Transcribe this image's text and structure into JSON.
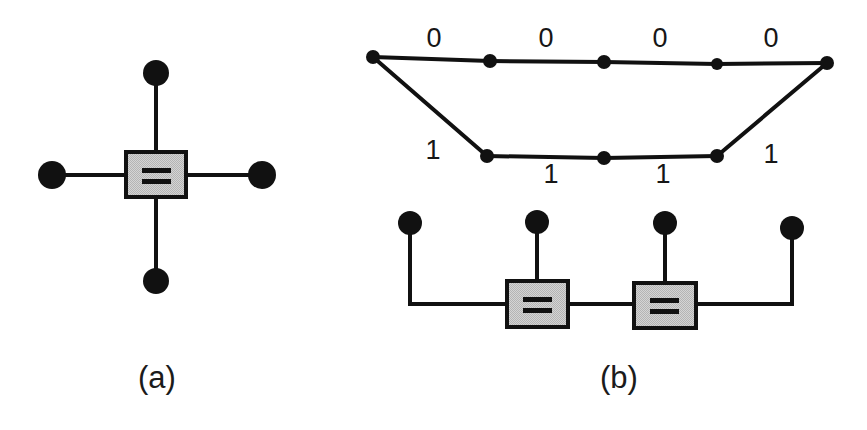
{
  "figure": {
    "background_color": "#ffffff",
    "ink_color": "#111111",
    "box_fill_color": "#c8c8c8",
    "box_border_color": "#111111",
    "panels": [
      {
        "id": "a",
        "caption": "(a)",
        "caption_x": 157,
        "caption_y": 388,
        "description": "equality constraint node with four half-edge variable terminals",
        "equality_box": {
          "label": "=",
          "x": 126,
          "y": 152,
          "width": 60,
          "height": 45
        },
        "variable_nodes": [
          {
            "name": "top",
            "cx": 156,
            "cy": 73,
            "r": 13
          },
          {
            "name": "left",
            "cx": 52,
            "cy": 175,
            "r": 14
          },
          {
            "name": "right",
            "cx": 262,
            "cy": 175,
            "r": 14
          },
          {
            "name": "bottom",
            "cx": 156,
            "cy": 281,
            "r": 13
          }
        ],
        "edges": [
          {
            "from": "top",
            "to": "box"
          },
          {
            "from": "left",
            "to": "box"
          },
          {
            "from": "right",
            "to": "box"
          },
          {
            "from": "bottom",
            "to": "box"
          }
        ]
      },
      {
        "id": "b",
        "caption": "(b)",
        "caption_x": 619,
        "caption_y": 388,
        "description": "trellis section with 0/1 branch labels above a factor graph of two equality nodes",
        "trellis": {
          "nodes": [
            {
              "name": "left-root",
              "cx": 373,
              "cy": 57,
              "r": 7
            },
            {
              "name": "top-1",
              "cx": 490,
              "cy": 61,
              "r": 7
            },
            {
              "name": "top-2",
              "cx": 604,
              "cy": 62,
              "r": 7
            },
            {
              "name": "top-3",
              "cx": 717,
              "cy": 64,
              "r": 6
            },
            {
              "name": "right-root",
              "cx": 827,
              "cy": 63,
              "r": 7
            },
            {
              "name": "bottom-1",
              "cx": 487,
              "cy": 156,
              "r": 7
            },
            {
              "name": "bottom-2",
              "cx": 604,
              "cy": 158,
              "r": 7
            },
            {
              "name": "bottom-3",
              "cx": 717,
              "cy": 156,
              "r": 7
            }
          ],
          "branches": [
            {
              "from": "left-root",
              "to": "top-1",
              "label": "0",
              "label_x": 434,
              "label_y": 47
            },
            {
              "from": "top-1",
              "to": "top-2",
              "label": "0",
              "label_x": 546,
              "label_y": 47
            },
            {
              "from": "top-2",
              "to": "top-3",
              "label": "0",
              "label_x": 660,
              "label_y": 47
            },
            {
              "from": "top-3",
              "to": "right-root",
              "label": "0",
              "label_x": 771,
              "label_y": 47
            },
            {
              "from": "left-root",
              "to": "bottom-1",
              "label": "1",
              "label_x": 433,
              "label_y": 159
            },
            {
              "from": "bottom-1",
              "to": "bottom-2",
              "label": "1",
              "label_x": 551,
              "label_y": 183
            },
            {
              "from": "bottom-2",
              "to": "bottom-3",
              "label": "1",
              "label_x": 663,
              "label_y": 183
            },
            {
              "from": "bottom-3",
              "to": "right-root",
              "label": "1",
              "label_x": 771,
              "label_y": 163
            }
          ]
        },
        "factor_graph": {
          "equality_boxes": [
            {
              "label": "=",
              "x": 507,
              "y": 281,
              "width": 61,
              "height": 46
            },
            {
              "label": "=",
              "x": 634,
              "y": 283,
              "width": 62,
              "height": 45
            }
          ],
          "variable_nodes": [
            {
              "name": "fg-node-1",
              "cx": 410,
              "cy": 223,
              "r": 12
            },
            {
              "name": "fg-node-2",
              "cx": 537,
              "cy": 222,
              "r": 12
            },
            {
              "name": "fg-node-3",
              "cx": 665,
              "cy": 223,
              "r": 12
            },
            {
              "name": "fg-node-4",
              "cx": 792,
              "cy": 228,
              "r": 12
            }
          ],
          "edges": [
            {
              "from": "fg-node-1",
              "to": "equality-box-1",
              "route": "down-then-right"
            },
            {
              "from": "fg-node-2",
              "to": "equality-box-1",
              "route": "straight-down"
            },
            {
              "from": "equality-box-1",
              "to": "equality-box-2",
              "route": "horizontal"
            },
            {
              "from": "fg-node-3",
              "to": "equality-box-2",
              "route": "straight-down"
            },
            {
              "from": "fg-node-4",
              "to": "equality-box-2",
              "route": "down-then-left"
            }
          ]
        }
      }
    ]
  }
}
